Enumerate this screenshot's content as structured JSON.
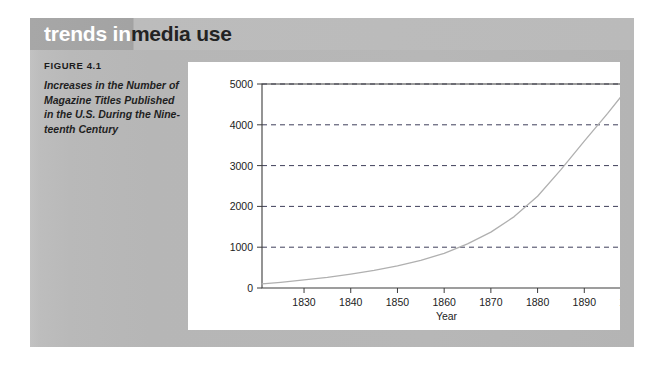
{
  "panel": {
    "title_primary": "trends in",
    "title_secondary": "media use",
    "figure_number": "FIGURE 4.1",
    "caption_lines": [
      "Increases in the Number of",
      "Magazine Titles Published",
      "in the U.S. During the Nine-",
      "teenth Century"
    ],
    "colors": {
      "panel_gray": "#b8b8b8",
      "title_band_dark": "#a3a3a3",
      "title_band_light": "#bababa",
      "title_primary_text": "#ffffff",
      "title_secondary_text": "#232323",
      "card_background": "#ffffff",
      "curve": "#b0b0b0",
      "gridline": "#3f3f5a",
      "axis": "#3c3c3c"
    }
  },
  "chart_data": {
    "type": "line",
    "title": "",
    "subtitle": "",
    "xlabel": "Year",
    "ylabel": "",
    "xlim": [
      1821,
      1900
    ],
    "ylim": [
      0,
      5000
    ],
    "xticks": [
      1830,
      1840,
      1850,
      1860,
      1870,
      1880,
      1890,
      1900
    ],
    "xtick_labels": [
      "1830",
      "1840",
      "1850",
      "1860",
      "1870",
      "1880",
      "1890",
      "1900"
    ],
    "yticks": [
      0,
      1000,
      2000,
      3000,
      4000,
      5000
    ],
    "ytick_labels": [
      "0",
      "1000",
      "2000",
      "3000",
      "4000",
      "5000"
    ],
    "grid": "horizontal-dashed",
    "legend": "none",
    "series": [
      {
        "name": "Magazine titles published in the U.S.",
        "x": [
          1821,
          1825,
          1830,
          1835,
          1840,
          1845,
          1850,
          1855,
          1860,
          1865,
          1870,
          1875,
          1880,
          1885,
          1890,
          1895,
          1900
        ],
        "values": [
          100,
          140,
          200,
          260,
          340,
          430,
          540,
          680,
          850,
          1080,
          1370,
          1750,
          2250,
          2900,
          3600,
          4280,
          5000
        ]
      }
    ]
  }
}
